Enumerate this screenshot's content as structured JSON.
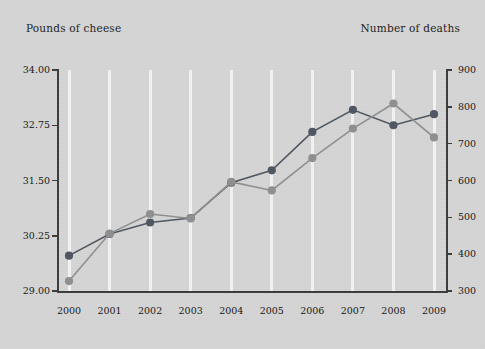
{
  "labels": {
    "left_axis_title": "Pounds of cheese",
    "right_axis_title": "Number of deaths"
  },
  "colors": {
    "background": "#d4d4d4",
    "gridline": "#f2f2f2",
    "axis": "#3a3a3a",
    "series_cheese": "#4d5560",
    "series_deaths": "#8e8e8e",
    "text": "#141414"
  },
  "chart_data": {
    "type": "line",
    "title": "",
    "xlabel": "",
    "categories": [
      "2000",
      "2001",
      "2002",
      "2003",
      "2004",
      "2005",
      "2006",
      "2007",
      "2008",
      "2009"
    ],
    "grid": "vertical",
    "legend": "none",
    "axes": {
      "left": {
        "label": "Pounds of cheese",
        "ticks": [
          "29.00",
          "30.25",
          "31.50",
          "32.75",
          "34.00"
        ],
        "tick_values": [
          29.0,
          30.25,
          31.5,
          32.75,
          34.0
        ],
        "ylim": [
          29.0,
          34.0
        ]
      },
      "right": {
        "label": "Number of deaths",
        "ticks": [
          "300",
          "400",
          "500",
          "600",
          "700",
          "800",
          "900"
        ],
        "tick_values": [
          300,
          400,
          500,
          600,
          700,
          800,
          900
        ],
        "ylim": [
          300,
          900
        ]
      },
      "x": {
        "ticks": [
          "2000",
          "2001",
          "2002",
          "2003",
          "2004",
          "2005",
          "2006",
          "2007",
          "2008",
          "2009"
        ]
      }
    },
    "series": [
      {
        "name": "Pounds of cheese",
        "axis": "left",
        "color": "#4d5560",
        "values": [
          29.8,
          30.29,
          30.55,
          30.65,
          31.45,
          31.73,
          32.6,
          33.1,
          32.75,
          33.0
        ]
      },
      {
        "name": "Number of deaths",
        "axis": "right",
        "color": "#8e8e8e",
        "values": [
          327,
          456,
          509,
          497,
          596,
          573,
          661,
          741,
          809,
          717
        ]
      }
    ]
  }
}
